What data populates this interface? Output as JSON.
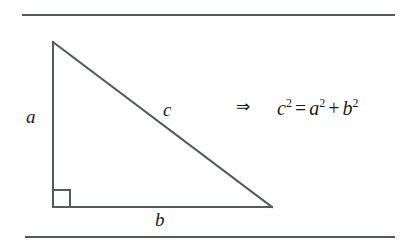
{
  "figure": {
    "name": "pythagorean-theorem-right-triangle",
    "background_color": "#ffffff",
    "stroke_color": "#555a5e",
    "text_color": "#1a1a1a",
    "width": 409,
    "height": 252,
    "rules": {
      "top": {
        "x": 22,
        "y": 14,
        "width": 373,
        "thickness": 2
      },
      "bottom": {
        "x": 25,
        "y": 236,
        "width": 370,
        "thickness": 2
      }
    },
    "triangle": {
      "type": "right-triangle",
      "vertices": {
        "apex": {
          "x": 53,
          "y": 42
        },
        "right_angle": {
          "x": 53,
          "y": 207
        },
        "base_end": {
          "x": 272,
          "y": 207
        }
      },
      "right_angle_marker": {
        "x": 53,
        "y": 190,
        "size": 17
      },
      "stroke_width": 2
    },
    "labels": {
      "leg_vertical": "a",
      "hypotenuse": "c",
      "leg_horizontal": "b"
    },
    "implication": {
      "symbol": "⇒",
      "name": "implies"
    },
    "equation": {
      "full_text": "c² = a² + b²",
      "left_var": "c",
      "left_exp": "2",
      "equals": "=",
      "term1_var": "a",
      "term1_exp": "2",
      "plus": "+",
      "term2_var": "b",
      "term2_exp": "2"
    }
  }
}
